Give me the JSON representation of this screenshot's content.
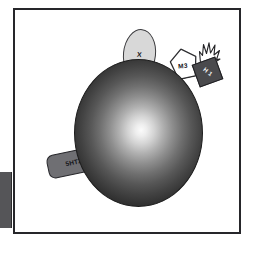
{
  "figure": {
    "title": "",
    "background_color": "#ffffff",
    "frame_color": "#26262a",
    "cell_body": {
      "name": "cell-body",
      "shape": "shaded-sphere",
      "highlight_color": "#fbfbfb",
      "shadow_color": "#262626"
    },
    "edge_fragment": {
      "name": "edge-block",
      "color": "#555558"
    },
    "receptors": [
      {
        "id": "x",
        "label": "X",
        "shape": "ellipse",
        "fill": "#d8d8d8",
        "text_color": "#151518",
        "position": "top-left-of-cell"
      },
      {
        "id": "m3",
        "label": "M3",
        "shape": "pentagon",
        "fill": "#ffffff",
        "text_color": "#151518",
        "position": "top-right-of-cell"
      },
      {
        "id": "h1",
        "label": "H 1",
        "shape": "square",
        "fill": "#4a4a4d",
        "text_color": "#f4f4f4",
        "position": "upper-right-of-cell",
        "decoration": "starburst"
      },
      {
        "id": "5ht2c",
        "label": "5HT2C",
        "shape": "rounded-rectangle",
        "fill": "#6f6f73",
        "text_color": "#15151a",
        "position": "left-of-cell"
      }
    ]
  }
}
